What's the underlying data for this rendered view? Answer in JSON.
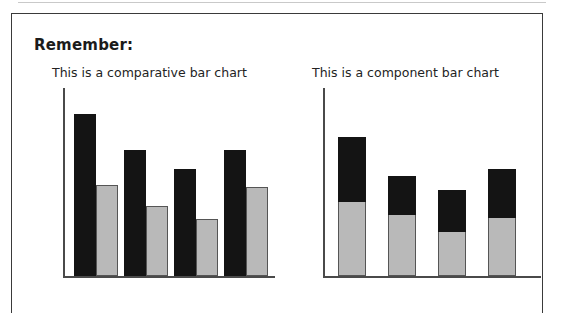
{
  "page": {
    "title": "Remember:",
    "accent_dark": "#141414",
    "accent_light": "#b9b9b9",
    "border_color": "#3a3a3a"
  },
  "charts": [
    {
      "id": "comparative",
      "caption": "This is a comparative bar chart"
    },
    {
      "id": "component",
      "caption": "This is a component bar chart"
    }
  ],
  "chart_data": [
    {
      "type": "bar",
      "title": "This is a comparative bar chart",
      "layout": "grouped",
      "categories": [
        "1",
        "2",
        "3",
        "4"
      ],
      "series": [
        {
          "name": "dark",
          "color": "#141414",
          "values": [
            100,
            78,
            66,
            78
          ]
        },
        {
          "name": "light",
          "color": "#b9b9b9",
          "values": [
            56,
            43,
            35,
            55
          ]
        }
      ],
      "xlabel": "",
      "ylabel": "",
      "ylim": [
        0,
        110
      ],
      "grid": false,
      "legend": "none",
      "ticks": {
        "x": [],
        "y": []
      }
    },
    {
      "type": "bar",
      "title": "This is a component bar chart",
      "layout": "stacked",
      "categories": [
        "1",
        "2",
        "3",
        "4"
      ],
      "series": [
        {
          "name": "light",
          "color": "#b9b9b9",
          "values": [
            46,
            38,
            27,
            36
          ]
        },
        {
          "name": "dark",
          "color": "#141414",
          "values": [
            40,
            24,
            26,
            30
          ]
        }
      ],
      "totals": [
        86,
        62,
        53,
        66
      ],
      "xlabel": "",
      "ylabel": "",
      "ylim": [
        0,
        110
      ],
      "grid": false,
      "legend": "none",
      "ticks": {
        "x": [],
        "y": []
      }
    }
  ]
}
